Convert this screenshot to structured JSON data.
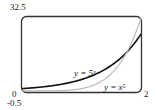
{
  "chart_data": {
    "type": "line",
    "title": "",
    "xlabel": "",
    "ylabel": "",
    "xlim": [
      0,
      2
    ],
    "ylim": [
      -0.5,
      32.5
    ],
    "tick_labels": {
      "y_top": "32.5",
      "y_bottom": "-0.5",
      "x_left": "0",
      "x_right": "2"
    },
    "grid": false,
    "series": [
      {
        "name": "y = 5^x",
        "label": "y = 5ˣ",
        "color": "#111111",
        "x": [
          0,
          0.25,
          0.5,
          0.75,
          1.0,
          1.25,
          1.5,
          1.75,
          2.0
        ],
        "y": [
          1,
          1.5,
          2.24,
          3.34,
          5.0,
          7.48,
          11.18,
          16.72,
          25.0
        ]
      },
      {
        "name": "y = x^5",
        "label": "y = x⁵",
        "color": "#bbbbbb",
        "x": [
          0,
          0.25,
          0.5,
          0.75,
          1.0,
          1.25,
          1.5,
          1.75,
          2.0
        ],
        "y": [
          0,
          0.001,
          0.031,
          0.237,
          1.0,
          3.05,
          7.59,
          16.41,
          32.0
        ]
      }
    ],
    "annotations": [
      "y = 5ˣ",
      "y = x⁵"
    ]
  }
}
